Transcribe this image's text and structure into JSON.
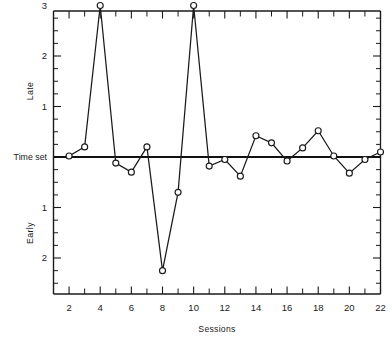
{
  "chart_data": {
    "type": "line",
    "title": "",
    "subtitle": "",
    "xlabel": "Sessions",
    "ylabel": "",
    "y_axis_upper_label": "Late",
    "y_axis_lower_label": "Early",
    "zero_label": "Time set",
    "grid": false,
    "legend": null,
    "xlim": [
      1,
      22
    ],
    "ylim": [
      -2.5,
      3.25
    ],
    "x_tick_interval_minor": 1,
    "x_ticks_labeled": [
      2,
      4,
      6,
      8,
      10,
      12,
      14,
      16,
      18,
      20,
      22
    ],
    "x_tick_labels": [
      "2",
      "4",
      "6",
      "8",
      "10",
      "12",
      "14",
      "16",
      "18",
      "20",
      "22"
    ],
    "y_ticks_labeled": [
      3,
      2,
      1,
      0,
      -1,
      -2
    ],
    "y_tick_labels": [
      "3",
      "2",
      "1",
      "Time set",
      "1",
      "2"
    ],
    "y_tick_interval_minor": 0.25,
    "marker": "open-circle",
    "x": [
      2,
      3,
      4,
      5,
      6,
      7,
      8,
      9,
      10,
      11,
      12,
      13,
      14,
      15,
      16,
      17,
      18,
      19,
      20,
      21,
      22
    ],
    "values": [
      0.02,
      0.2,
      3.0,
      -0.12,
      -0.3,
      0.2,
      -2.25,
      -0.7,
      3.0,
      -0.18,
      -0.05,
      -0.38,
      0.42,
      0.28,
      -0.08,
      0.18,
      0.52,
      0.02,
      -0.32,
      -0.05,
      0.1
    ],
    "series": [
      {
        "name": "deviation from time set",
        "values": [
          0.02,
          0.2,
          3.0,
          -0.12,
          -0.3,
          0.2,
          -2.25,
          -0.7,
          3.0,
          -0.18,
          -0.05,
          -0.38,
          0.42,
          0.28,
          -0.08,
          0.18,
          0.52,
          0.02,
          -0.32,
          -0.05,
          0.1
        ]
      }
    ],
    "colors": {
      "line": "#1a1a1a",
      "marker_fill": "#ffffff",
      "axis": "#1a1a1a",
      "zero_line": "#111111"
    }
  }
}
